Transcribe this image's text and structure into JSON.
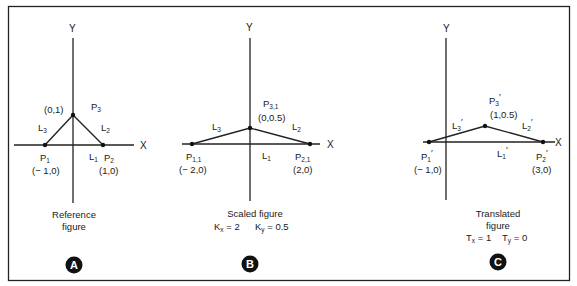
{
  "frame": {
    "border_color": "#222222"
  },
  "panels": [
    {
      "id": "A",
      "badge": "A",
      "axes": {
        "x_label": "X",
        "y_label": "Y"
      },
      "points": {
        "p1": {
          "name": "P",
          "sub": "1",
          "coord": "(− 1,0)"
        },
        "p2": {
          "name": "P",
          "sub": "2",
          "coord": "(1,0)"
        },
        "p3": {
          "name": "P",
          "sub": "3",
          "coord": "(0,1)"
        }
      },
      "lines": {
        "l1": {
          "name": "L",
          "sub": "1"
        },
        "l2": {
          "name": "L",
          "sub": "2"
        },
        "l3": {
          "name": "L",
          "sub": "3"
        }
      },
      "caption": {
        "line1": "Reference",
        "line2": "figure"
      }
    },
    {
      "id": "B",
      "badge": "B",
      "axes": {
        "x_label": "X",
        "y_label": "Y"
      },
      "points": {
        "p1": {
          "name": "P",
          "sub": "1,1",
          "coord": "(− 2,0)"
        },
        "p2": {
          "name": "P",
          "sub": "2,1",
          "coord": "(2,0)"
        },
        "p3": {
          "name": "P",
          "sub": "3,1",
          "coord": "(0,0.5)"
        }
      },
      "lines": {
        "l1": {
          "name": "L",
          "sub": "1"
        },
        "l2": {
          "name": "L",
          "sub": "2"
        },
        "l3": {
          "name": "L",
          "sub": "3"
        }
      },
      "caption": {
        "line1": "Scaled figure",
        "param1": {
          "name": "K",
          "sub": "x",
          "value": " = 2"
        },
        "param2": {
          "name": "K",
          "sub": "y",
          "value": " = 0.5"
        }
      }
    },
    {
      "id": "C",
      "badge": "C",
      "axes": {
        "x_label": "X",
        "y_label": "Y"
      },
      "points": {
        "p1": {
          "name": "P",
          "sub": "1",
          "prime": "′",
          "coord": "(− 1,0)"
        },
        "p2": {
          "name": "P",
          "sub": "2",
          "prime": "′",
          "coord": "(3,0)"
        },
        "p3": {
          "name": "P",
          "sub": "3",
          "prime": "′",
          "coord": "(1,0.5)"
        }
      },
      "lines": {
        "l1": {
          "name": "L",
          "sub": "1",
          "prime": "′"
        },
        "l2": {
          "name": "L",
          "sub": "2",
          "prime": "′"
        },
        "l3": {
          "name": "L",
          "sub": "3",
          "prime": "′"
        }
      },
      "caption": {
        "line1": "Translated",
        "line2": "figure",
        "param1": {
          "name": "T",
          "sub": "x",
          "value": " = 1"
        },
        "param2": {
          "name": "T",
          "sub": "y",
          "value": " = 0"
        }
      }
    }
  ]
}
